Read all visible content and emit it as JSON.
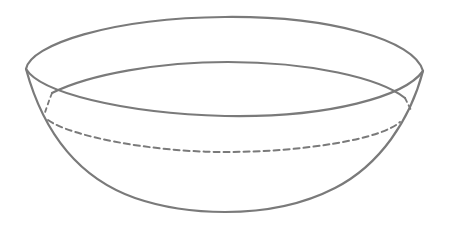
{
  "figure": {
    "stroke_color": "#7a7a7a",
    "background_color": "#ffffff",
    "parts": [
      {
        "name": "outer-rim",
        "style": "solid"
      },
      {
        "name": "inner-rim-back",
        "style": "solid"
      },
      {
        "name": "bowl-body",
        "style": "solid"
      },
      {
        "name": "hidden-level-line",
        "style": "dashed"
      }
    ]
  }
}
